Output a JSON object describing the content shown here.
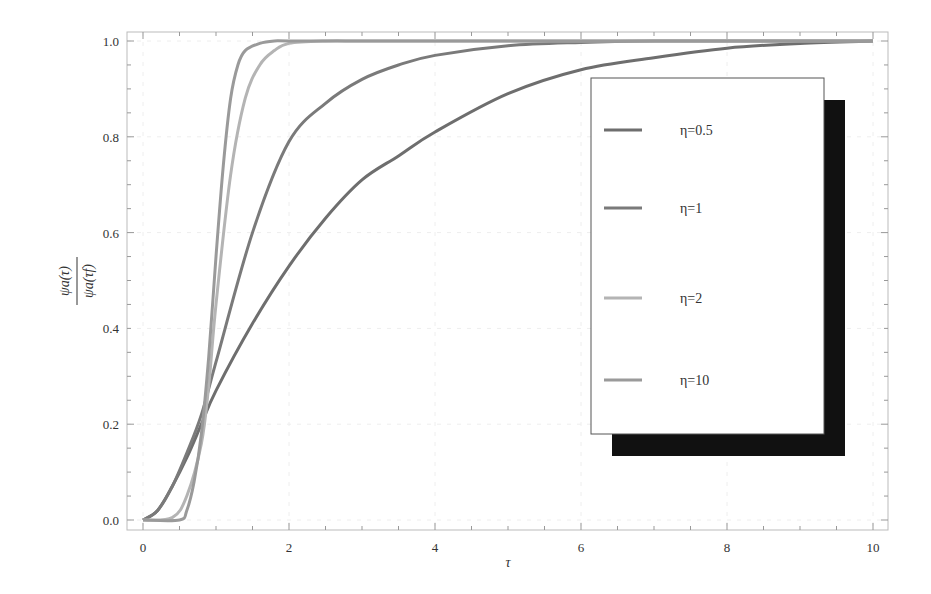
{
  "chart_data": {
    "type": "line",
    "title": "",
    "xlabel": "τ",
    "ylabel_numerator": "ψa(τ)",
    "ylabel_denominator": "ψa(τf)",
    "xlim": [
      -0.2,
      10.2
    ],
    "ylim": [
      -0.02,
      1.02
    ],
    "xticks": [
      0,
      2,
      4,
      6,
      8,
      10
    ],
    "xtick_labels": [
      "0",
      "2",
      "4",
      "6",
      "8",
      "10"
    ],
    "yticks": [
      0.0,
      0.2,
      0.4,
      0.6,
      0.8,
      1.0
    ],
    "ytick_labels": [
      "0.0",
      "0.2",
      "0.4",
      "0.6",
      "0.8",
      "1.0"
    ],
    "grid": true,
    "legend_position": "right-inside",
    "series": [
      {
        "name": "η=0.5",
        "color": "#6e6e6e",
        "x": [
          0,
          0.2,
          0.4,
          0.6,
          0.8,
          1,
          1.5,
          2,
          2.5,
          3,
          3.5,
          4,
          5,
          6,
          7,
          8,
          9,
          10
        ],
        "values": [
          0,
          0.02,
          0.07,
          0.13,
          0.2,
          0.27,
          0.41,
          0.53,
          0.63,
          0.71,
          0.76,
          0.81,
          0.89,
          0.94,
          0.965,
          0.985,
          0.995,
          1.0
        ]
      },
      {
        "name": "η=1",
        "color": "#7a7a7a",
        "x": [
          0,
          0.2,
          0.4,
          0.6,
          0.8,
          1,
          1.5,
          2,
          2.5,
          3,
          3.5,
          4,
          5,
          6,
          7,
          8,
          10
        ],
        "values": [
          0,
          0.02,
          0.07,
          0.14,
          0.22,
          0.33,
          0.6,
          0.79,
          0.87,
          0.92,
          0.95,
          0.97,
          0.99,
          0.997,
          1.0,
          1.0,
          1.0
        ]
      },
      {
        "name": "η=2",
        "color": "#b4b4b4",
        "x": [
          0,
          0.4,
          0.6,
          0.8,
          0.9,
          1,
          1.2,
          1.4,
          1.6,
          1.8,
          2,
          2.5,
          3,
          4,
          6,
          10
        ],
        "values": [
          0,
          0.005,
          0.05,
          0.16,
          0.28,
          0.45,
          0.72,
          0.88,
          0.95,
          0.98,
          0.995,
          1.0,
          1.0,
          1.0,
          1.0,
          1.0
        ]
      },
      {
        "name": "η=10",
        "color": "#9a9a9a",
        "x": [
          0,
          0.5,
          0.6,
          0.7,
          0.8,
          0.9,
          1,
          1.1,
          1.2,
          1.3,
          1.4,
          1.6,
          1.8,
          2,
          3,
          10
        ],
        "values": [
          0,
          0.0,
          0.02,
          0.08,
          0.18,
          0.34,
          0.55,
          0.74,
          0.88,
          0.95,
          0.98,
          0.995,
          1.0,
          1.0,
          1.0,
          1.0
        ]
      }
    ]
  },
  "legend": {
    "items": [
      "η=0.5",
      "η=1",
      "η=2",
      "η=10"
    ]
  }
}
